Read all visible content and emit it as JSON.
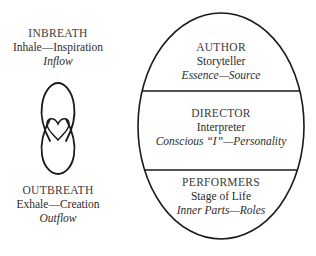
{
  "left_panel": {
    "top": {
      "heading": "INBREATH",
      "subtitle": "Inhale—Inspiration",
      "italic": "Inflow"
    },
    "symbol": "figure-eight-with-heart-icon",
    "bottom": {
      "heading": "OUTBREATH",
      "subtitle": "Exhale—Creation",
      "italic": "Outflow"
    }
  },
  "oval": {
    "sections": [
      {
        "heading": "AUTHOR",
        "subtitle": "Storyteller",
        "italic": "Essence—Source"
      },
      {
        "heading": "DIRECTOR",
        "subtitle": "Interpreter",
        "italic": "Conscious “I”—Personality"
      },
      {
        "heading": "PERFORMERS",
        "subtitle": "Stage of Life",
        "italic": "Inner Parts—Roles"
      }
    ]
  },
  "colors": {
    "stroke": "#1a1a1a",
    "text": "#2b2b2b",
    "background": "#ffffff"
  }
}
